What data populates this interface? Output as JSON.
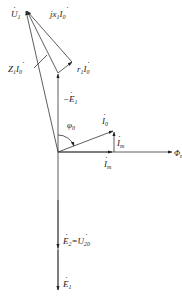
{
  "diagram": {
    "colors": {
      "line": "#333333",
      "text": "#222222",
      "background": "#ffffff"
    },
    "labels": {
      "U1": {
        "base": "U",
        "dot": true,
        "sub": "1"
      },
      "jx1I0": {
        "prefix": "jx",
        "prefix_sub": "1",
        "base": "I",
        "dot": true,
        "sub": "0"
      },
      "Z1I0": {
        "prefix": "Z",
        "prefix_sub": "1",
        "base": "I",
        "dot": true,
        "sub": "0"
      },
      "r1I0": {
        "prefix": "r",
        "prefix_sub": "1",
        "base": "I",
        "dot": true,
        "sub": "0"
      },
      "neg_E1": {
        "prefix": "−",
        "base": "E",
        "dot": true,
        "sub": "1"
      },
      "phi0": {
        "base": "φ",
        "sub": "0"
      },
      "I0": {
        "base": "I",
        "dot": true,
        "sub": "0"
      },
      "Im_vertical": {
        "base": "I",
        "dot": true,
        "sub": "m"
      },
      "Im_horizontal": {
        "base": "I",
        "dot": true,
        "sub": "m"
      },
      "Phi_m": {
        "base": "Φ",
        "sub": "m"
      },
      "E2_eq_U20": {
        "base": "E",
        "dot": true,
        "sub": "2",
        "eq": "=",
        "base2": "U",
        "dot2": true,
        "sub2": "20"
      },
      "E1": {
        "base": "E",
        "dot": true,
        "sub": "1"
      }
    },
    "phasors": [
      {
        "name": "U1",
        "from": [
          58,
          152
        ],
        "to": [
          26,
          10
        ]
      },
      {
        "name": "-E1",
        "from": [
          58,
          152
        ],
        "to": [
          58,
          73
        ]
      },
      {
        "name": "r1I0",
        "from": [
          58,
          73
        ],
        "to": [
          72,
          62
        ]
      },
      {
        "name": "jx1I0",
        "from": [
          72,
          62
        ],
        "to": [
          26,
          10
        ]
      },
      {
        "name": "Z1I0",
        "from": [
          58,
          73
        ],
        "to": [
          26,
          10
        ]
      },
      {
        "name": "I0",
        "from": [
          58,
          152
        ],
        "to": [
          114,
          131
        ]
      },
      {
        "name": "Im_vertical",
        "from": [
          114,
          152
        ],
        "to": [
          114,
          131
        ]
      },
      {
        "name": "Im",
        "from": [
          58,
          152
        ],
        "to": [
          112,
          152
        ]
      },
      {
        "name": "Phi_m",
        "from": [
          58,
          152
        ],
        "to": [
          170,
          152
        ]
      },
      {
        "name": "E2=U20",
        "from": [
          58,
          152
        ],
        "to": [
          58,
          248
        ]
      },
      {
        "name": "E1",
        "from": [
          58,
          152
        ],
        "to": [
          58,
          290
        ]
      }
    ]
  }
}
